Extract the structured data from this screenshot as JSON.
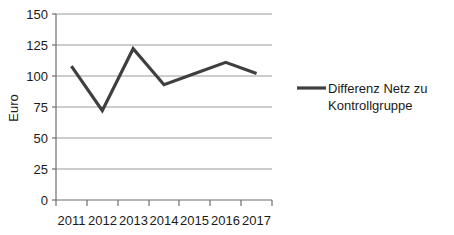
{
  "chart_data": {
    "type": "line",
    "title": "",
    "xlabel": "",
    "ylabel": "Euro",
    "categories": [
      "2011",
      "2012",
      "2013",
      "2014",
      "2015",
      "2016",
      "2017"
    ],
    "series": [
      {
        "name": "Differenz Netz zu Kontrollgruppe",
        "values": [
          108,
          72,
          122,
          93,
          102,
          111,
          102
        ],
        "color": "#3f3f3f"
      }
    ],
    "ylim": [
      0,
      150
    ],
    "yticks": [
      0,
      25,
      50,
      75,
      100,
      125,
      150
    ],
    "ytick_labels": [
      "0",
      "25",
      "50",
      "75",
      "100",
      "125",
      "150"
    ],
    "grid": true,
    "grid_axis": "y",
    "legend_position": "right",
    "legend_entries": [
      {
        "label_line1": "Differenz Netz zu",
        "label_line2": "Kontrollgruppe",
        "color": "#3f3f3f"
      }
    ],
    "colors": {
      "series_line": "#3f3f3f",
      "gridline": "#9a9a9a",
      "axis": "#6e6e6e",
      "text": "#1a1a1a",
      "background": "#ffffff"
    }
  }
}
